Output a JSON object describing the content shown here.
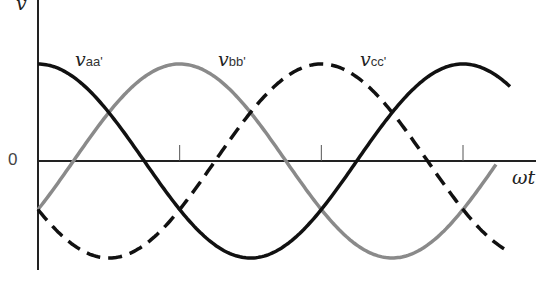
{
  "chart_data": {
    "type": "line",
    "title": "",
    "xlabel": "ωt",
    "ylabel": "v",
    "y_zero_label": "0",
    "x_range_deg": [
      0,
      420
    ],
    "x_ticks_deg": [
      120,
      240,
      360
    ],
    "amplitude": 1,
    "series": [
      {
        "name": "v_aa'",
        "label_main": "v",
        "label_sub": "aa'",
        "phase_deg": 0,
        "style": "solid",
        "color": "#111111"
      },
      {
        "name": "v_bb'",
        "label_main": "v",
        "label_sub": "bb'",
        "phase_deg": -120,
        "style": "solid",
        "color": "#8a8a8a"
      },
      {
        "name": "v_cc'",
        "label_main": "v",
        "label_sub": "cc'",
        "phase_deg": 120,
        "style": "dashed",
        "color": "#111111"
      }
    ]
  }
}
